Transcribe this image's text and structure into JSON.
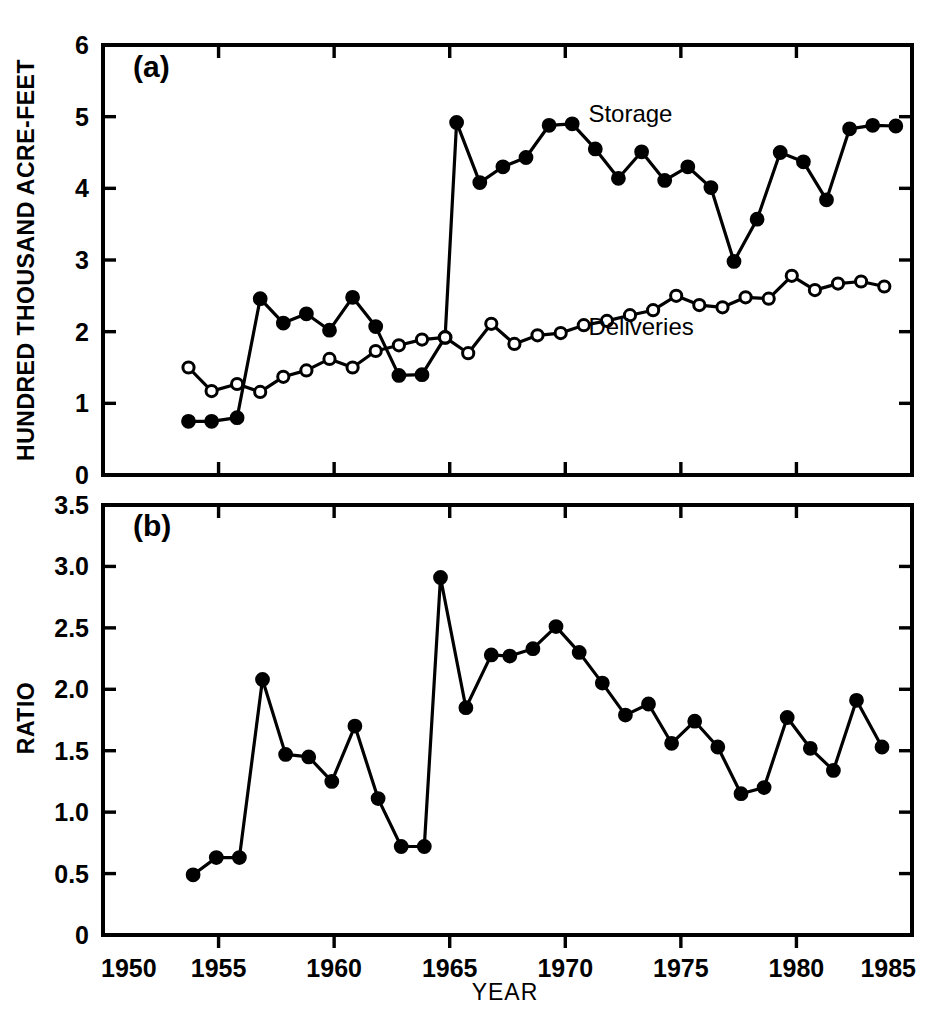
{
  "figure": {
    "background": "#ffffff",
    "ink": "#000000",
    "panels": [
      "(a)",
      "(b)"
    ]
  },
  "chart_data": [
    {
      "type": "line",
      "panel": "(a)",
      "title": "",
      "xlabel": "YEAR",
      "ylabel": "HUNDRED THOUSAND ACRE-FEET",
      "xlim": [
        1950,
        1985
      ],
      "ylim": [
        0,
        6
      ],
      "xticks": [
        1950,
        1955,
        1960,
        1965,
        1970,
        1975,
        1980,
        1985
      ],
      "xticklabels": [
        "1950",
        "1955",
        "1960",
        "1965",
        "1970",
        "1975",
        "1980",
        "1985"
      ],
      "yticks": [
        0,
        1,
        2,
        3,
        4,
        5,
        6
      ],
      "yticklabels": [
        "0",
        "1",
        "2",
        "3",
        "4",
        "5",
        "6"
      ],
      "grid": false,
      "legend_position": "inline-annotation",
      "annotations": [
        {
          "text": "Storage",
          "x": 1971.0,
          "y": 4.92
        },
        {
          "text": "Deliveries",
          "x": 1971.0,
          "y": 1.95
        },
        {
          "text": "(a)",
          "x": 1951.3,
          "y": 5.55
        }
      ],
      "series": [
        {
          "name": "Storage",
          "marker": "filled-circle",
          "x": [
            1953.7,
            1954.7,
            1955.8,
            1956.8,
            1957.8,
            1958.8,
            1959.8,
            1960.8,
            1961.8,
            1962.8,
            1963.8,
            1964.8,
            1965.3,
            1966.3,
            1967.3,
            1968.3,
            1969.3,
            1970.3,
            1971.3,
            1972.3,
            1973.3,
            1974.3,
            1975.3,
            1976.3,
            1977.3,
            1978.3,
            1979.3,
            1980.3,
            1981.3,
            1982.3,
            1983.3,
            1984.3
          ],
          "values": [
            0.75,
            0.75,
            0.8,
            2.46,
            2.12,
            2.25,
            2.02,
            2.48,
            2.07,
            1.39,
            1.4,
            1.92,
            4.92,
            4.08,
            4.3,
            4.43,
            4.88,
            4.9,
            4.55,
            4.14,
            4.51,
            4.11,
            4.3,
            4.01,
            2.98,
            3.57,
            4.5,
            4.37,
            3.84,
            4.83,
            4.88,
            4.87
          ]
        },
        {
          "name": "Deliveries",
          "marker": "open-circle",
          "x": [
            1953.7,
            1954.7,
            1955.8,
            1956.8,
            1957.8,
            1958.8,
            1959.8,
            1960.8,
            1961.8,
            1962.8,
            1963.8,
            1964.8,
            1965.8,
            1966.8,
            1967.8,
            1968.8,
            1969.8,
            1970.8,
            1971.8,
            1972.8,
            1973.8,
            1974.8,
            1975.8,
            1976.8,
            1977.8,
            1978.8,
            1979.8,
            1980.8,
            1981.8,
            1982.8,
            1983.8
          ],
          "values": [
            1.5,
            1.17,
            1.27,
            1.16,
            1.37,
            1.46,
            1.62,
            1.5,
            1.73,
            1.81,
            1.89,
            1.92,
            1.7,
            2.11,
            1.83,
            1.95,
            1.98,
            2.09,
            2.15,
            2.23,
            2.3,
            2.5,
            2.37,
            2.34,
            2.48,
            2.46,
            2.78,
            2.58,
            2.67,
            2.7,
            2.63,
            2.44,
            2.95
          ]
        }
      ]
    },
    {
      "type": "line",
      "panel": "(b)",
      "title": "",
      "xlabel": "YEAR",
      "ylabel": "RATIO",
      "xlim": [
        1950,
        1985
      ],
      "ylim": [
        0,
        3.5
      ],
      "xticks": [
        1950,
        1955,
        1960,
        1965,
        1970,
        1975,
        1980,
        1985
      ],
      "xticklabels": [
        "1950",
        "1955",
        "1960",
        "1965",
        "1970",
        "1975",
        "1980",
        "1985"
      ],
      "yticks": [
        0,
        0.5,
        1.0,
        1.5,
        2.0,
        2.5,
        3.0,
        3.5
      ],
      "yticklabels": [
        "0",
        "0.5",
        "1.0",
        "1.5",
        "2.0",
        "2.5",
        "3.0",
        "3.5"
      ],
      "grid": false,
      "annotations": [
        {
          "text": "(b)",
          "x": 1951.3,
          "y": 3.25
        }
      ],
      "series": [
        {
          "name": "Ratio",
          "marker": "filled-circle",
          "x": [
            1953.9,
            1954.9,
            1955.9,
            1956.9,
            1957.9,
            1958.9,
            1959.9,
            1960.9,
            1961.9,
            1962.9,
            1963.9,
            1964.6,
            1965.7,
            1966.8,
            1967.6,
            1968.6,
            1969.6,
            1970.6,
            1971.6,
            1972.6,
            1973.6,
            1974.6,
            1975.6,
            1976.6,
            1977.6,
            1978.6,
            1979.6,
            1980.6,
            1981.6,
            1982.6,
            1983.7
          ],
          "values": [
            0.49,
            0.63,
            0.63,
            2.08,
            1.47,
            1.45,
            1.25,
            1.7,
            1.11,
            0.72,
            0.72,
            2.91,
            1.85,
            2.28,
            2.27,
            2.33,
            2.51,
            2.3,
            2.05,
            1.79,
            1.88,
            1.56,
            1.74,
            1.53,
            1.15,
            1.2,
            1.77,
            1.52,
            1.34,
            1.91,
            1.53
          ]
        }
      ]
    }
  ]
}
